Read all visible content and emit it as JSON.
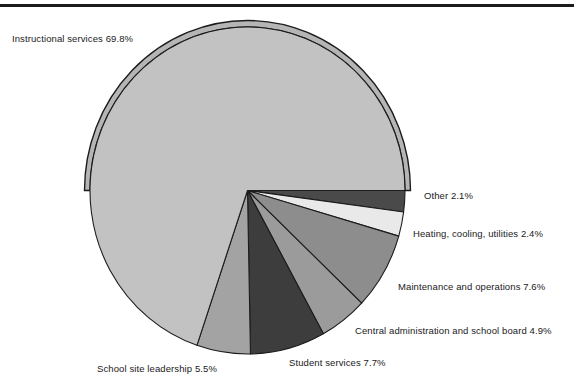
{
  "figure": {
    "top_rule": true,
    "background": "#ffffff"
  },
  "chart_data": {
    "type": "pie",
    "title": "",
    "xlabel": "",
    "ylabel": "",
    "units": "percent",
    "legend_position": "callout-labels",
    "grid": false,
    "start_angle_deg": 0,
    "direction": "clockwise",
    "categories": [
      "Other",
      "Heating, cooling, utilities",
      "Maintenance and operations",
      "Central administration and school board",
      "Student services",
      "School site leadership",
      "Instructional services"
    ],
    "values": [
      2.1,
      2.4,
      7.6,
      4.9,
      7.7,
      5.5,
      69.8
    ],
    "slices": [
      {
        "label": "Other",
        "value": 2.1,
        "display": "Other  2.1%",
        "color": "#4a4a4a"
      },
      {
        "label": "Heating, cooling, utilities",
        "value": 2.4,
        "display": "Heating, cooling, utilities  2.4%",
        "color": "#e9e9e9"
      },
      {
        "label": "Maintenance and operations",
        "value": 7.6,
        "display": "Maintenance and operations  7.6%",
        "color": "#8d8d8d"
      },
      {
        "label": "Central administration and school board",
        "value": 4.9,
        "display": "Central administration and school board  4.9%",
        "color": "#9b9b9b"
      },
      {
        "label": "Student services",
        "value": 7.7,
        "display": "Student services  7.7%",
        "color": "#3d3d3d"
      },
      {
        "label": "School site leadership",
        "value": 5.5,
        "display": "School site leadership  5.5%",
        "color": "#a3a3a3"
      },
      {
        "label": "Instructional services",
        "value": 69.8,
        "display": "Instructional services  69.8%",
        "color": "#c2c2c2"
      }
    ]
  },
  "labels": {
    "instructional_services": "Instructional services  69.8%",
    "other": "Other  2.1%",
    "heating_cooling_utilities": "Heating, cooling, utilities  2.4%",
    "maintenance_and_operations": "Maintenance and operations  7.6%",
    "central_administration": "Central administration and school board  4.9%",
    "student_services": "Student services  7.7%",
    "school_site_leadership": "School site leadership  5.5%"
  },
  "colors": {
    "outline": "#1c1c1c",
    "rule": "#1c1c1c",
    "text": "#1a1a1a",
    "instructional": "#c2c2c2",
    "rim": "#b5b5b5"
  }
}
